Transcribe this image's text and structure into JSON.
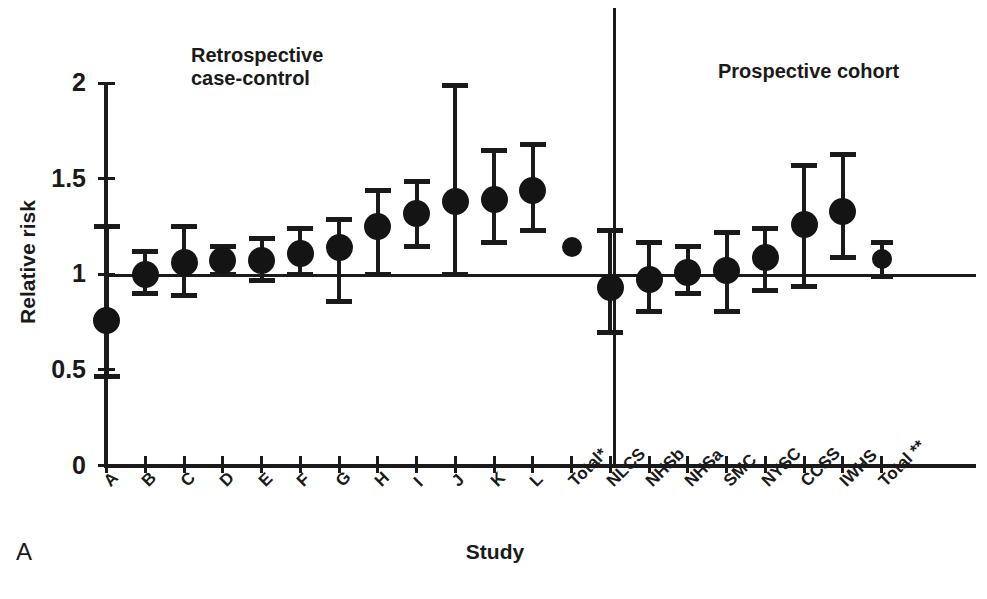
{
  "panel_label": "A",
  "axes": {
    "y_title": "Relative risk",
    "x_title": "Study",
    "y_ticks": [
      "2",
      "1.5",
      "1",
      "0.5",
      "0"
    ]
  },
  "groups": {
    "left_title": "Retrospective\ncase-control",
    "right_title": "Prospective cohort"
  },
  "chart_data": {
    "type": "scatter",
    "title": "",
    "subtitle": "",
    "xlabel": "Study",
    "ylabel": "Relative risk",
    "ylim": [
      0,
      2
    ],
    "yticks": [
      0,
      0.5,
      1,
      1.5,
      2
    ],
    "grid": false,
    "legend": null,
    "reference_line": 1,
    "annotations": [
      {
        "text": "Retrospective case-control",
        "group": "left"
      },
      {
        "text": "Prospective cohort",
        "group": "right"
      },
      {
        "text": "A",
        "role": "panel-label"
      }
    ],
    "group_divider_after": "Total*",
    "categories": [
      "A",
      "B",
      "C",
      "D",
      "E",
      "F",
      "G",
      "H",
      "I",
      "J",
      "K",
      "L",
      "Total*",
      "NLCS",
      "NHSb",
      "NHSa",
      "SMC",
      "NYSC",
      "CCSS",
      "IWHS",
      "Total **"
    ],
    "series": [
      {
        "name": "Relative risk (point estimate with 95% CI)",
        "points": [
          {
            "label": "A",
            "group": "Retrospective case-control",
            "value": 0.76,
            "ci_low": 0.47,
            "ci_high": 1.25
          },
          {
            "label": "B",
            "group": "Retrospective case-control",
            "value": 1.0,
            "ci_low": 0.9,
            "ci_high": 1.12
          },
          {
            "label": "C",
            "group": "Retrospective case-control",
            "value": 1.06,
            "ci_low": 0.89,
            "ci_high": 1.25
          },
          {
            "label": "D",
            "group": "Retrospective case-control",
            "value": 1.07,
            "ci_low": 1.0,
            "ci_high": 1.15
          },
          {
            "label": "E",
            "group": "Retrospective case-control",
            "value": 1.07,
            "ci_low": 0.97,
            "ci_high": 1.19
          },
          {
            "label": "F",
            "group": "Retrospective case-control",
            "value": 1.11,
            "ci_low": 1.0,
            "ci_high": 1.24
          },
          {
            "label": "G",
            "group": "Retrospective case-control",
            "value": 1.14,
            "ci_low": 0.86,
            "ci_high": 1.29
          },
          {
            "label": "H",
            "group": "Retrospective case-control",
            "value": 1.25,
            "ci_low": 1.0,
            "ci_high": 1.44
          },
          {
            "label": "I",
            "group": "Retrospective case-control",
            "value": 1.32,
            "ci_low": 1.15,
            "ci_high": 1.49
          },
          {
            "label": "J",
            "group": "Retrospective case-control",
            "value": 1.38,
            "ci_low": 1.0,
            "ci_high": 1.99
          },
          {
            "label": "K",
            "group": "Retrospective case-control",
            "value": 1.39,
            "ci_low": 1.17,
            "ci_high": 1.65
          },
          {
            "label": "L",
            "group": "Retrospective case-control",
            "value": 1.44,
            "ci_low": 1.23,
            "ci_high": 1.68
          },
          {
            "label": "Total*",
            "group": "Retrospective case-control",
            "value": 1.14,
            "ci_low": null,
            "ci_high": null
          },
          {
            "label": "NLCS",
            "group": "Prospective cohort",
            "value": 0.93,
            "ci_low": 0.7,
            "ci_high": 1.23
          },
          {
            "label": "NHSb",
            "group": "Prospective cohort",
            "value": 0.97,
            "ci_low": 0.81,
            "ci_high": 1.17
          },
          {
            "label": "NHSa",
            "group": "Prospective cohort",
            "value": 1.01,
            "ci_low": 0.9,
            "ci_high": 1.15
          },
          {
            "label": "SMC",
            "group": "Prospective cohort",
            "value": 1.02,
            "ci_low": 0.81,
            "ci_high": 1.22
          },
          {
            "label": "NYSC",
            "group": "Prospective cohort",
            "value": 1.09,
            "ci_low": 0.92,
            "ci_high": 1.24
          },
          {
            "label": "CCSS",
            "group": "Prospective cohort",
            "value": 1.26,
            "ci_low": 0.94,
            "ci_high": 1.57
          },
          {
            "label": "IWHS",
            "group": "Prospective cohort",
            "value": 1.33,
            "ci_low": 1.09,
            "ci_high": 1.63
          },
          {
            "label": "Total **",
            "group": "Prospective cohort",
            "value": 1.08,
            "ci_low": 0.99,
            "ci_high": 1.17
          }
        ]
      }
    ]
  }
}
